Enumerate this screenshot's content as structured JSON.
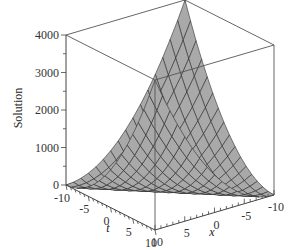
{
  "chart_data": {
    "type": "surface3d",
    "title": "",
    "function": "Solution = 10*(x + t)^2",
    "zlabel": "Solution",
    "tlabel": "t",
    "xlabel": "x",
    "t_range": [
      -10,
      10
    ],
    "x_range": [
      -10,
      10
    ],
    "z_range": [
      0,
      4000
    ],
    "z_ticks": [
      0,
      1000,
      2000,
      3000,
      4000
    ],
    "t_ticks": [
      -10,
      -5,
      0,
      5,
      10
    ],
    "x_ticks": [
      10,
      5,
      0,
      -5,
      -10
    ],
    "grid_n": 16,
    "surface_color": "#a9a9a9",
    "mesh_color": "#222222",
    "box": true,
    "corner_values": [
      {
        "t": -10,
        "x": 10,
        "z": 4000
      },
      {
        "t": 10,
        "x": -10,
        "z": 4000
      },
      {
        "t": -10,
        "x": -10,
        "z": 0
      },
      {
        "t": 10,
        "x": 10,
        "z": 0
      }
    ]
  },
  "labels": {
    "zlabel": "Solution",
    "tlabel": "t",
    "xlabel": "x",
    "z_ticks": [
      "0",
      "1000",
      "2000",
      "3000",
      "4000"
    ],
    "t_ticks": [
      "-10",
      "-5",
      "0",
      "5",
      "10"
    ],
    "x_ticks": [
      "10",
      "5",
      "0",
      "-5",
      "-10"
    ]
  }
}
